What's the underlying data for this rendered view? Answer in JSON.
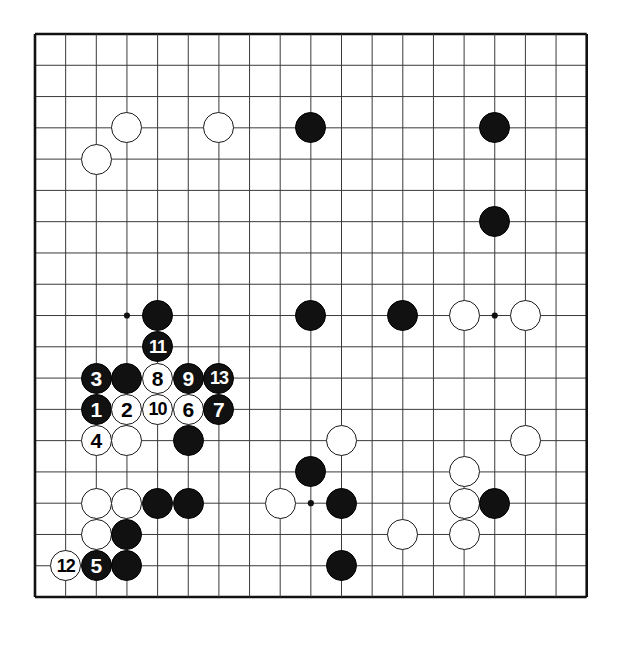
{
  "board": {
    "name": "go-board-diagram",
    "size": 19,
    "left": 35,
    "top": 34,
    "spacing": 30.65,
    "vspacing": 31.28,
    "line_color": "#3a3a3a",
    "border_color": "#111111",
    "background_color": "#ffffff",
    "black_color": "#111111",
    "white_color": "#ffffff",
    "stone_radius": 15.5,
    "star_points": [
      {
        "col": 3,
        "row": 3
      },
      {
        "col": 9,
        "row": 3
      },
      {
        "col": 15,
        "row": 3
      },
      {
        "col": 3,
        "row": 9
      },
      {
        "col": 9,
        "row": 9
      },
      {
        "col": 15,
        "row": 9
      },
      {
        "col": 3,
        "row": 15
      },
      {
        "col": 9,
        "row": 15
      },
      {
        "col": 15,
        "row": 15
      }
    ]
  },
  "stones": [
    {
      "name": "white-stone-c3r3",
      "color": "white",
      "col": 3,
      "row": 3,
      "label": ""
    },
    {
      "name": "white-stone-c2r4",
      "color": "white",
      "col": 2,
      "row": 4,
      "label": ""
    },
    {
      "name": "white-stone-c6r3",
      "color": "white",
      "col": 6,
      "row": 3,
      "label": ""
    },
    {
      "name": "black-stone-c9r3",
      "color": "black",
      "col": 9,
      "row": 3,
      "label": ""
    },
    {
      "name": "black-stone-c15r3",
      "color": "black",
      "col": 15,
      "row": 3,
      "label": ""
    },
    {
      "name": "black-stone-c15r6",
      "color": "black",
      "col": 15,
      "row": 6,
      "label": ""
    },
    {
      "name": "black-stone-c4r9",
      "color": "black",
      "col": 4,
      "row": 9,
      "label": ""
    },
    {
      "name": "black-stone-c9r9",
      "color": "black",
      "col": 9,
      "row": 9,
      "label": ""
    },
    {
      "name": "black-stone-c12r9",
      "color": "black",
      "col": 12,
      "row": 9,
      "label": ""
    },
    {
      "name": "white-stone-c14r9",
      "color": "white",
      "col": 14,
      "row": 9,
      "label": ""
    },
    {
      "name": "white-stone-c16r9",
      "color": "white",
      "col": 16,
      "row": 9,
      "label": ""
    },
    {
      "name": "move-11-black",
      "color": "black",
      "col": 4,
      "row": 10,
      "label": "11"
    },
    {
      "name": "move-3-black",
      "color": "black",
      "col": 2,
      "row": 11,
      "label": "3"
    },
    {
      "name": "black-stone-c3r11",
      "color": "black",
      "col": 3,
      "row": 11,
      "label": ""
    },
    {
      "name": "move-8-white",
      "color": "white",
      "col": 4,
      "row": 11,
      "label": "8"
    },
    {
      "name": "move-9-black",
      "color": "black",
      "col": 5,
      "row": 11,
      "label": "9"
    },
    {
      "name": "move-13-black",
      "color": "black",
      "col": 6,
      "row": 11,
      "label": "13"
    },
    {
      "name": "move-1-black",
      "color": "black",
      "col": 2,
      "row": 12,
      "label": "1"
    },
    {
      "name": "move-2-white",
      "color": "white",
      "col": 3,
      "row": 12,
      "label": "2"
    },
    {
      "name": "move-10-white",
      "color": "white",
      "col": 4,
      "row": 12,
      "label": "10"
    },
    {
      "name": "move-6-white",
      "color": "white",
      "col": 5,
      "row": 12,
      "label": "6"
    },
    {
      "name": "move-7-black",
      "color": "black",
      "col": 6,
      "row": 12,
      "label": "7"
    },
    {
      "name": "move-4-white",
      "color": "white",
      "col": 2,
      "row": 13,
      "label": "4"
    },
    {
      "name": "white-stone-c3r13",
      "color": "white",
      "col": 3,
      "row": 13,
      "label": ""
    },
    {
      "name": "black-stone-c5r13",
      "color": "black",
      "col": 5,
      "row": 13,
      "label": ""
    },
    {
      "name": "white-stone-c10r13",
      "color": "white",
      "col": 10,
      "row": 13,
      "label": ""
    },
    {
      "name": "white-stone-c16r13",
      "color": "white",
      "col": 16,
      "row": 13,
      "label": ""
    },
    {
      "name": "black-stone-c9r14",
      "color": "black",
      "col": 9,
      "row": 14,
      "label": ""
    },
    {
      "name": "white-stone-c14r14",
      "color": "white",
      "col": 14,
      "row": 14,
      "label": ""
    },
    {
      "name": "white-stone-c2r15",
      "color": "white",
      "col": 2,
      "row": 15,
      "label": ""
    },
    {
      "name": "white-stone-c3r15",
      "color": "white",
      "col": 3,
      "row": 15,
      "label": ""
    },
    {
      "name": "black-stone-c4r15",
      "color": "black",
      "col": 4,
      "row": 15,
      "label": ""
    },
    {
      "name": "black-stone-c5r15",
      "color": "black",
      "col": 5,
      "row": 15,
      "label": ""
    },
    {
      "name": "white-stone-c8r15",
      "color": "white",
      "col": 8,
      "row": 15,
      "label": ""
    },
    {
      "name": "black-stone-c10r15",
      "color": "black",
      "col": 10,
      "row": 15,
      "label": ""
    },
    {
      "name": "white-stone-c14r15",
      "color": "white",
      "col": 14,
      "row": 15,
      "label": ""
    },
    {
      "name": "black-stone-c15r15",
      "color": "black",
      "col": 15,
      "row": 15,
      "label": ""
    },
    {
      "name": "white-stone-c2r16",
      "color": "white",
      "col": 2,
      "row": 16,
      "label": ""
    },
    {
      "name": "black-stone-c3r16",
      "color": "black",
      "col": 3,
      "row": 16,
      "label": ""
    },
    {
      "name": "white-stone-c12r16",
      "color": "white",
      "col": 12,
      "row": 16,
      "label": ""
    },
    {
      "name": "white-stone-c14r16",
      "color": "white",
      "col": 14,
      "row": 16,
      "label": ""
    },
    {
      "name": "move-12-white",
      "color": "white",
      "col": 1,
      "row": 17,
      "label": "12"
    },
    {
      "name": "move-5-black",
      "color": "black",
      "col": 2,
      "row": 17,
      "label": "5"
    },
    {
      "name": "black-stone-c3r17",
      "color": "black",
      "col": 3,
      "row": 17,
      "label": ""
    },
    {
      "name": "black-stone-c10r17",
      "color": "black",
      "col": 10,
      "row": 17,
      "label": ""
    }
  ],
  "move_numbers": [
    "1",
    "2",
    "3",
    "4",
    "5",
    "6",
    "7",
    "8",
    "9",
    "10",
    "11",
    "12",
    "13"
  ]
}
